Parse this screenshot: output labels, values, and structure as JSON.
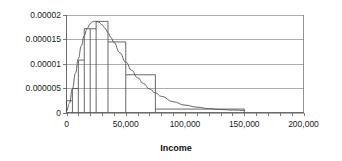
{
  "chart_data": {
    "type": "bar",
    "title": "",
    "subtitle": "",
    "xlabel": "Income",
    "ylabel": "",
    "xlim": [
      0,
      200000
    ],
    "ylim": [
      0,
      2e-05
    ],
    "grid": true,
    "legend": false,
    "x_tick_labels": [
      "0",
      "50,000",
      "100,000",
      "150,000",
      "200,000"
    ],
    "x_tick_values": [
      0,
      50000,
      100000,
      150000,
      200000
    ],
    "x_minor_tick_values": [
      0,
      10000,
      20000,
      30000,
      40000,
      50000,
      60000,
      70000,
      80000,
      90000,
      100000,
      110000,
      120000,
      130000,
      140000,
      150000,
      160000,
      170000,
      180000,
      190000,
      200000
    ],
    "y_tick_labels": [
      "0",
      "0.000005",
      "0.00001",
      "0.000015",
      "0.00002"
    ],
    "y_tick_values": [
      0,
      5e-06,
      1e-05,
      1.5e-05,
      2e-05
    ],
    "bins": [
      {
        "start": 0,
        "end": 5000,
        "density": 2.4e-06
      },
      {
        "start": 5000,
        "end": 10000,
        "density": 4.9e-06
      },
      {
        "start": 10000,
        "end": 15000,
        "density": 1.07e-05
      },
      {
        "start": 15000,
        "end": 20000,
        "density": 1.71e-05
      },
      {
        "start": 20000,
        "end": 25000,
        "density": 1.71e-05
      },
      {
        "start": 25000,
        "end": 35000,
        "density": 1.86e-05
      },
      {
        "start": 35000,
        "end": 50000,
        "density": 1.44e-05
      },
      {
        "start": 50000,
        "end": 75000,
        "density": 7.7e-06
      },
      {
        "start": 75000,
        "end": 150000,
        "density": 7e-07
      }
    ],
    "curve": {
      "name": "fitted density curve",
      "points": [
        [
          0,
          2e-07
        ],
        [
          2500,
          1.9e-06
        ],
        [
          5000,
          4.8e-06
        ],
        [
          7500,
          8e-06
        ],
        [
          10000,
          1.1e-05
        ],
        [
          12500,
          1.36e-05
        ],
        [
          15000,
          1.57e-05
        ],
        [
          17500,
          1.72e-05
        ],
        [
          20000,
          1.81e-05
        ],
        [
          22500,
          1.86e-05
        ],
        [
          25000,
          1.86e-05
        ],
        [
          27500,
          1.84e-05
        ],
        [
          30000,
          1.79e-05
        ],
        [
          32500,
          1.72e-05
        ],
        [
          35000,
          1.63e-05
        ],
        [
          37500,
          1.53e-05
        ],
        [
          40000,
          1.43e-05
        ],
        [
          45000,
          1.22e-05
        ],
        [
          50000,
          1.03e-05
        ],
        [
          55000,
          8.6e-06
        ],
        [
          60000,
          7.1e-06
        ],
        [
          65000,
          5.9e-06
        ],
        [
          70000,
          4.8e-06
        ],
        [
          75000,
          4e-06
        ],
        [
          80000,
          3.3e-06
        ],
        [
          90000,
          2.2e-06
        ],
        [
          100000,
          1.5e-06
        ],
        [
          110000,
          1.1e-06
        ],
        [
          120000,
          8e-07
        ],
        [
          130000,
          6e-07
        ],
        [
          140000,
          5e-07
        ],
        [
          150000,
          4e-07
        ]
      ]
    },
    "colors": {
      "histogram_outline": "#4d4d4d",
      "curve": "#555555",
      "gridline": "#8c8c8c",
      "axis": "#5a5a5a",
      "text": "#1a1a1a",
      "background": "#ffffff"
    }
  }
}
